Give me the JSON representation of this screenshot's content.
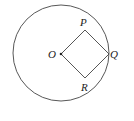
{
  "diagram": {
    "type": "geometry",
    "circle": {
      "cx": 61,
      "cy": 53,
      "r": 48,
      "stroke": "#444444"
    },
    "points": {
      "O": {
        "x": 61,
        "y": 54,
        "label": "O"
      },
      "P": {
        "x": 85,
        "y": 30,
        "label": "P"
      },
      "Q": {
        "x": 109,
        "y": 54,
        "label": "Q"
      },
      "R": {
        "x": 85,
        "y": 78,
        "label": "R"
      }
    },
    "labels": {
      "O": "O",
      "P": "P",
      "Q": "Q",
      "R": "R"
    },
    "line_color": "#444444"
  }
}
